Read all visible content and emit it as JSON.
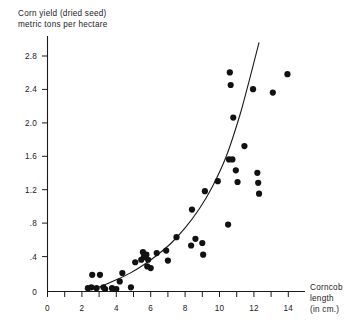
{
  "chart_data": {
    "type": "scatter",
    "title": "Corn yield (dried seed) metric tons per hectare",
    "title_line1": "Corn yield (dried seed)",
    "title_line2": "metric tons per hectare",
    "xlabel": "Corncob length (in cm.)",
    "xlabel_line1": "Corncob",
    "xlabel_line2": "length",
    "xlabel_line3": "(in cm.)",
    "ylabel": "Corn yield (dried seed) metric tons per hectare",
    "xlim": [
      0,
      15.6
    ],
    "ylim": [
      0,
      3.0
    ],
    "grid": false,
    "legend": null,
    "x_ticks": [
      0,
      2,
      4,
      6,
      8,
      10,
      12,
      14
    ],
    "x_tick_labels": [
      "0",
      "2",
      "4",
      "6",
      "8",
      "10",
      "12",
      "14"
    ],
    "x_minor_ticks": [
      1,
      3,
      5,
      7,
      9,
      11,
      13,
      15
    ],
    "y_ticks": [
      0,
      0.4,
      0.8,
      1.2,
      1.6,
      2.0,
      2.4,
      2.8
    ],
    "y_tick_labels": [
      "0",
      ".4",
      ".8",
      "1.2",
      "1.6",
      "2.0",
      "2.4",
      "2.8"
    ],
    "marker": "filled-circle",
    "marker_color": "#111111",
    "points": [
      {
        "x": 2.35,
        "y": 0.04
      },
      {
        "x": 2.55,
        "y": 0.05
      },
      {
        "x": 2.6,
        "y": 0.2
      },
      {
        "x": 2.85,
        "y": 0.04
      },
      {
        "x": 3.05,
        "y": 0.2
      },
      {
        "x": 3.25,
        "y": 0.05
      },
      {
        "x": 3.35,
        "y": 0.03
      },
      {
        "x": 3.75,
        "y": 0.04
      },
      {
        "x": 4.0,
        "y": 0.03
      },
      {
        "x": 4.2,
        "y": 0.12
      },
      {
        "x": 4.35,
        "y": 0.22
      },
      {
        "x": 4.85,
        "y": 0.05
      },
      {
        "x": 5.1,
        "y": 0.35
      },
      {
        "x": 5.45,
        "y": 0.38
      },
      {
        "x": 5.55,
        "y": 0.47
      },
      {
        "x": 5.6,
        "y": 0.41
      },
      {
        "x": 5.75,
        "y": 0.44
      },
      {
        "x": 5.8,
        "y": 0.3
      },
      {
        "x": 5.85,
        "y": 0.38
      },
      {
        "x": 6.0,
        "y": 0.28
      },
      {
        "x": 6.35,
        "y": 0.46
      },
      {
        "x": 6.9,
        "y": 0.49
      },
      {
        "x": 7.0,
        "y": 0.37
      },
      {
        "x": 7.5,
        "y": 0.65
      },
      {
        "x": 8.35,
        "y": 0.55
      },
      {
        "x": 8.4,
        "y": 0.98
      },
      {
        "x": 8.6,
        "y": 0.63
      },
      {
        "x": 9.0,
        "y": 0.58
      },
      {
        "x": 9.05,
        "y": 0.44
      },
      {
        "x": 9.15,
        "y": 1.2
      },
      {
        "x": 9.9,
        "y": 1.32
      },
      {
        "x": 10.5,
        "y": 0.8
      },
      {
        "x": 10.55,
        "y": 1.58
      },
      {
        "x": 10.6,
        "y": 2.62
      },
      {
        "x": 10.65,
        "y": 2.47
      },
      {
        "x": 10.75,
        "y": 1.58
      },
      {
        "x": 10.8,
        "y": 2.08
      },
      {
        "x": 10.95,
        "y": 1.45
      },
      {
        "x": 11.05,
        "y": 1.31
      },
      {
        "x": 11.45,
        "y": 1.74
      },
      {
        "x": 11.95,
        "y": 2.42
      },
      {
        "x": 12.2,
        "y": 1.42
      },
      {
        "x": 12.25,
        "y": 1.3
      },
      {
        "x": 12.3,
        "y": 1.17
      },
      {
        "x": 13.1,
        "y": 2.38
      },
      {
        "x": 13.95,
        "y": 2.6
      }
    ],
    "fit_curve": {
      "label": "fitted curve",
      "x": [
        2.5,
        3.2,
        4.0,
        4.8,
        5.6,
        6.4,
        7.2,
        8.0,
        8.8,
        9.6,
        10.4,
        11.2,
        11.8,
        12.3
      ],
      "y": [
        0.02,
        0.07,
        0.14,
        0.22,
        0.32,
        0.44,
        0.58,
        0.76,
        0.98,
        1.26,
        1.62,
        2.12,
        2.58,
        2.98
      ]
    }
  }
}
